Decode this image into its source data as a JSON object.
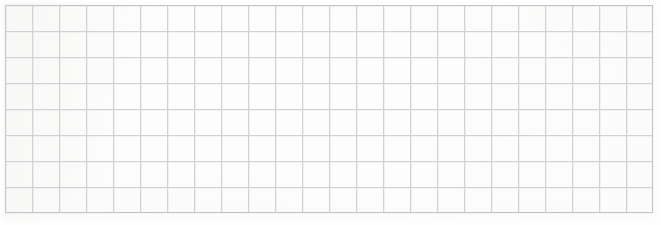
{
  "page": {
    "width": 661,
    "height": 225,
    "background_color": "#fdfdfd"
  },
  "grid": {
    "columns": 24,
    "rows": 8,
    "cell_width": 27,
    "cell_height": 26,
    "origin_x": 5,
    "origin_y": 5,
    "grid_width": 648,
    "grid_height": 208,
    "line_color": "#d2d2d5",
    "border_color": "#c4c4c8",
    "line_thickness": 1,
    "border_thickness": 1.4
  },
  "content": {
    "text_present": "none",
    "marks_present": "none",
    "label": ""
  }
}
